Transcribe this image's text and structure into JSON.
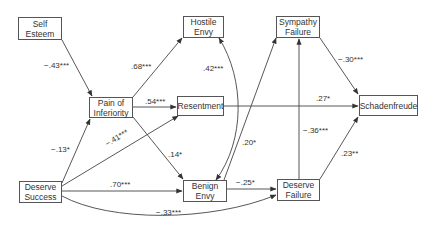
{
  "diagram": {
    "type": "path-model",
    "nodes": {
      "self_esteem": {
        "line1": "Self",
        "line2": "Esteem"
      },
      "pain_of_inferiority": {
        "line1": "Pain of",
        "line2": "Inferiority"
      },
      "hostile_envy": {
        "line1": "Hostile",
        "line2": "Envy"
      },
      "resentment": {
        "line1": "Resentment",
        "line2": ""
      },
      "sympathy_failure": {
        "line1": "Sympathy",
        "line2": "Failure"
      },
      "schadenfreude": {
        "line1": "Schadenfreude",
        "line2": ""
      },
      "deserve_success": {
        "line1": "Deserve",
        "line2": "Success"
      },
      "benign_envy": {
        "line1": "Benign",
        "line2": "Envy"
      },
      "deserve_failure": {
        "line1": "Deserve",
        "line2": "Failure"
      }
    },
    "edges": [
      {
        "id": "se_pi",
        "from": "Self Esteem",
        "to": "Pain of Inferiority",
        "label": "−.43***"
      },
      {
        "id": "pi_he",
        "from": "Pain of Inferiority",
        "to": "Hostile Envy",
        "label": ".68***"
      },
      {
        "id": "pi_res",
        "from": "Pain of Inferiority",
        "to": "Resentment",
        "label": ".54***"
      },
      {
        "id": "pi_be",
        "from": "Pain of Inferiority",
        "to": "Benign Envy",
        "label": ".14*"
      },
      {
        "id": "he_be",
        "from": "Hostile Envy",
        "to": "Benign Envy",
        "label": ".42***",
        "bidirectional": true
      },
      {
        "id": "ds_pi",
        "from": "Deserve Success",
        "to": "Pain of Inferiority",
        "label": "−.13*"
      },
      {
        "id": "ds_res",
        "from": "Deserve Success",
        "to": "Resentment",
        "label": "−.41***"
      },
      {
        "id": "ds_be",
        "from": "Deserve Success",
        "to": "Benign Envy",
        "label": ".70***"
      },
      {
        "id": "ds_df",
        "from": "Deserve Success",
        "to": "Deserve Failure",
        "label": "−.33***"
      },
      {
        "id": "be_sf",
        "from": "Benign Envy",
        "to": "Sympathy Failure",
        "label": ".20*"
      },
      {
        "id": "be_df",
        "from": "Benign Envy",
        "to": "Deserve Failure",
        "label": "−.25*"
      },
      {
        "id": "res_sch",
        "from": "Resentment",
        "to": "Schadenfreude",
        "label": ".27*"
      },
      {
        "id": "sf_sch",
        "from": "Sympathy Failure",
        "to": "Schadenfreude",
        "label": "−.30***"
      },
      {
        "id": "df_sf",
        "from": "Deserve Failure",
        "to": "Sympathy Failure",
        "label": "−.36***"
      },
      {
        "id": "df_sch",
        "from": "Deserve Failure",
        "to": "Schadenfreude",
        "label": ".23**"
      }
    ],
    "labels": {
      "se_pi": "−.43***",
      "pi_he": ".68***",
      "pi_res": ".54***",
      "pi_be": ".14*",
      "he_be": ".42***",
      "ds_pi": "−.13*",
      "ds_res": "−.41***",
      "ds_be": ".70***",
      "ds_df": "−.33***",
      "be_sf": ".20*",
      "be_df": "−.25*",
      "res_sch": ".27*",
      "sf_sch": "−.30***",
      "df_sf": "−.36***",
      "df_sch": ".23**"
    },
    "colors": {
      "line": "#444444",
      "box_border": "#555555",
      "text": "#333333",
      "background": "#ffffff"
    }
  }
}
